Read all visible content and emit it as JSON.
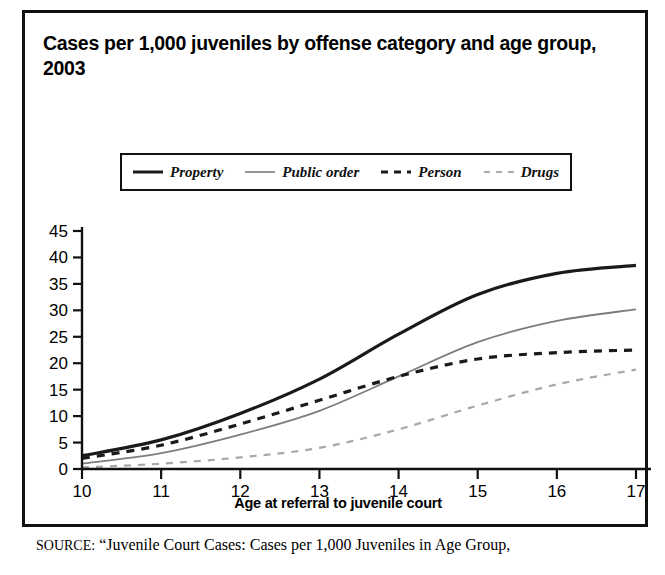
{
  "figure": {
    "title": "Cases per 1,000 juveniles by offense category and age group, 2003",
    "source_kicker": "SOURCE:",
    "source_text": "“Juvenile Court Cases: Cases per 1,000 Juveniles in Age Group,"
  },
  "chart_data": {
    "type": "line",
    "title": "Cases per 1,000 juveniles by offense category and age group, 2003",
    "xlabel": "Age at referral to juvenile court",
    "ylabel": "",
    "xlim": [
      10,
      17
    ],
    "ylim": [
      0,
      45
    ],
    "ytick_labels": [
      "0",
      "5",
      "10",
      "15",
      "20",
      "25",
      "30",
      "35",
      "40",
      "45"
    ],
    "yticks": [
      0,
      5,
      10,
      15,
      20,
      25,
      30,
      35,
      40,
      45
    ],
    "xtick_labels": [
      "10",
      "11",
      "12",
      "13",
      "14",
      "15",
      "16",
      "17"
    ],
    "x": [
      10,
      11,
      12,
      13,
      14,
      15,
      16,
      17
    ],
    "grid": false,
    "legend_position": "top-center",
    "series": [
      {
        "name": "Property",
        "values": [
          2.5,
          5.5,
          10.5,
          17.0,
          25.5,
          33.0,
          37.0,
          38.5
        ],
        "color": "#1a1a1a",
        "style": "solid",
        "width": 3.2
      },
      {
        "name": "Public order",
        "values": [
          1.0,
          3.0,
          6.5,
          11.0,
          17.5,
          24.0,
          28.0,
          30.2
        ],
        "color": "#7d7d7d",
        "style": "solid",
        "width": 1.8
      },
      {
        "name": "Person",
        "values": [
          2.0,
          4.5,
          8.5,
          13.0,
          17.5,
          20.8,
          22.0,
          22.5
        ],
        "color": "#1a1a1a",
        "style": "dashed",
        "width": 3.2
      },
      {
        "name": "Drugs",
        "values": [
          0.3,
          1.0,
          2.2,
          4.0,
          7.5,
          12.0,
          16.0,
          18.8
        ],
        "color": "#a8a8a8",
        "style": "dashed",
        "width": 2.2
      }
    ]
  },
  "axis": {
    "x_title": "Age at referral to juvenile court"
  }
}
